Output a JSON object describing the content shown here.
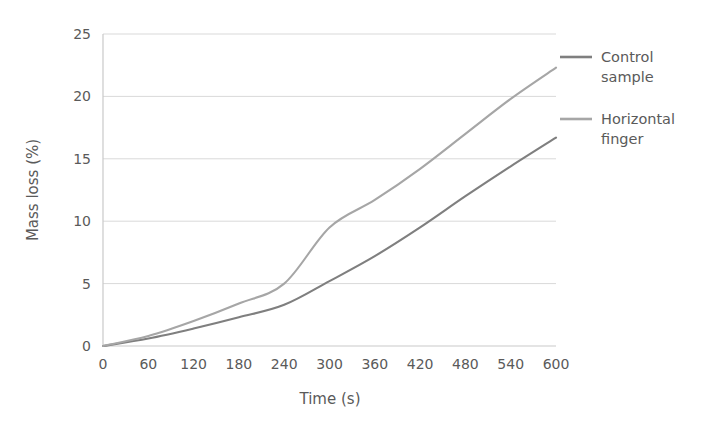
{
  "chart_data": {
    "type": "line",
    "title": "",
    "xlabel": "Time (s)",
    "ylabel": "Mass loss (%)",
    "x": [
      0,
      60,
      120,
      180,
      240,
      300,
      360,
      420,
      480,
      540,
      600
    ],
    "xticklabels": [
      "0",
      "60",
      "120",
      "180",
      "240",
      "300",
      "360",
      "420",
      "480",
      "540",
      "600"
    ],
    "yticklabels": [
      "0",
      "5",
      "10",
      "15",
      "20",
      "25"
    ],
    "yticks": [
      0,
      5,
      10,
      15,
      20,
      25
    ],
    "xlim": [
      0,
      600
    ],
    "ylim": [
      0,
      25
    ],
    "grid": "horizontal",
    "legend_position": "right",
    "series": [
      {
        "name": "Control sample",
        "label_line1": "Control",
        "label_line2": "sample",
        "color": "#7f7f7f",
        "values": [
          0.0,
          0.6,
          1.4,
          2.3,
          3.3,
          5.2,
          7.2,
          9.5,
          12.0,
          14.4,
          16.7
        ]
      },
      {
        "name": "Horizontal finger",
        "label_line1": "Horizontal",
        "label_line2": "finger",
        "color": "#a6a6a6",
        "values": [
          0.0,
          0.8,
          2.0,
          3.4,
          5.0,
          9.5,
          11.7,
          14.2,
          17.0,
          19.8,
          22.3
        ]
      }
    ]
  },
  "colors": {
    "gridline": "#d9d9d9",
    "axis": "#c9c9c9",
    "text": "#5a5a5a",
    "background": "#ffffff"
  }
}
